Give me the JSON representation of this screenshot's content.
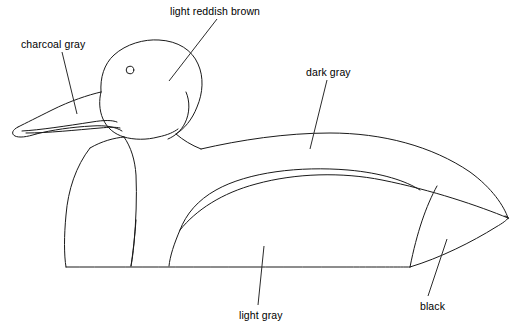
{
  "diagram": {
    "background_color": "#ffffff",
    "line_color": "#1a1a1a",
    "labels": [
      {
        "id": "charcoal-gray",
        "text": "charcoal gray",
        "target_part": "bill",
        "leader_from": [
          62,
          52
        ],
        "leader_to": [
          77,
          114
        ]
      },
      {
        "id": "light-reddish-brown",
        "text": "light reddish brown",
        "target_part": "head",
        "leader_from": [
          217,
          19
        ],
        "leader_to": [
          169,
          81
        ]
      },
      {
        "id": "dark-gray",
        "text": "dark gray",
        "target_part": "back",
        "leader_from": [
          327,
          80
        ],
        "leader_to": [
          310,
          149
        ]
      },
      {
        "id": "light-gray",
        "text": "light gray",
        "target_part": "side-flank",
        "leader_from": [
          264,
          246
        ],
        "leader_to": [
          258,
          305
        ]
      },
      {
        "id": "black",
        "text": "black",
        "target_part": "tail",
        "leader_from": [
          447,
          239
        ],
        "leader_to": [
          428,
          296
        ]
      }
    ]
  }
}
